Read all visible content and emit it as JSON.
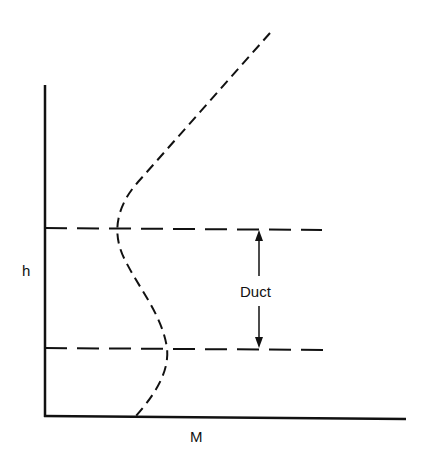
{
  "figure": {
    "y_axis_label": "h",
    "x_axis_label": "M",
    "annotation": "Duct"
  },
  "colors": {
    "ink": "#111111",
    "background": "#ffffff"
  }
}
